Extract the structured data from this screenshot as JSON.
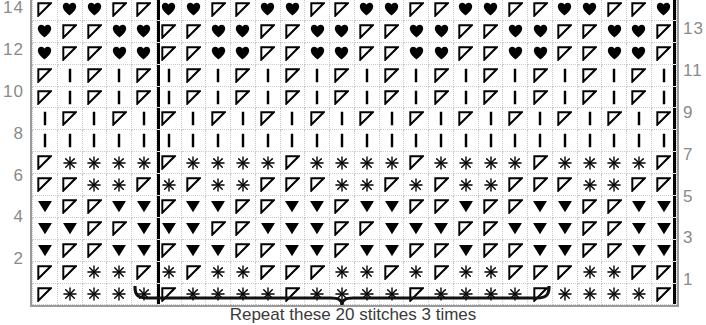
{
  "chart_data": {
    "type": "table",
    "grid_columns": 26,
    "grid_rows": 14,
    "symbol_legend": {
      "heart": "heart-symbol",
      "rt": "right-leaning-open-triangle",
      "dt": "filled-down-triangle",
      "bar": "vertical-bar-purl",
      "star": "asterisk-star"
    },
    "row_numbers_left": [
      "14",
      "12",
      "10",
      "8",
      "6",
      "4",
      "2"
    ],
    "row_numbers_right": [
      "13",
      "11",
      "9",
      "7",
      "5",
      "3",
      "1"
    ],
    "rows": [
      {
        "number": "14",
        "cells": [
          "rt",
          "heart",
          "heart",
          "rt",
          "rt",
          "heart",
          "heart",
          "rt",
          "rt",
          "heart",
          "heart",
          "rt",
          "rt",
          "heart",
          "heart",
          "rt",
          "rt",
          "heart",
          "heart",
          "rt",
          "rt",
          "heart",
          "heart",
          "rt",
          "rt",
          "heart"
        ]
      },
      {
        "number": "13",
        "cells": [
          "heart",
          "rt",
          "rt",
          "heart",
          "heart",
          "rt",
          "rt",
          "heart",
          "heart",
          "rt",
          "rt",
          "heart",
          "heart",
          "rt",
          "rt",
          "heart",
          "heart",
          "rt",
          "rt",
          "heart",
          "heart",
          "rt",
          "rt",
          "heart",
          "heart",
          "rt"
        ]
      },
      {
        "number": "12",
        "cells": [
          "heart",
          "rt",
          "rt",
          "heart",
          "heart",
          "rt",
          "rt",
          "heart",
          "heart",
          "rt",
          "rt",
          "heart",
          "heart",
          "rt",
          "rt",
          "heart",
          "heart",
          "rt",
          "rt",
          "heart",
          "heart",
          "rt",
          "rt",
          "heart",
          "heart",
          "rt"
        ]
      },
      {
        "number": "11",
        "cells": [
          "rt",
          "bar",
          "rt",
          "bar",
          "rt",
          "bar",
          "rt",
          "bar",
          "rt",
          "bar",
          "rt",
          "bar",
          "rt",
          "bar",
          "rt",
          "bar",
          "rt",
          "bar",
          "rt",
          "bar",
          "rt",
          "bar",
          "rt",
          "bar",
          "rt",
          "bar"
        ]
      },
      {
        "number": "10",
        "cells": [
          "rt",
          "bar",
          "rt",
          "bar",
          "rt",
          "bar",
          "rt",
          "bar",
          "rt",
          "bar",
          "rt",
          "bar",
          "rt",
          "bar",
          "rt",
          "bar",
          "rt",
          "bar",
          "rt",
          "bar",
          "rt",
          "bar",
          "rt",
          "bar",
          "rt",
          "bar"
        ]
      },
      {
        "number": "9",
        "cells": [
          "bar",
          "rt",
          "bar",
          "rt",
          "bar",
          "rt",
          "bar",
          "rt",
          "bar",
          "rt",
          "bar",
          "rt",
          "bar",
          "rt",
          "bar",
          "rt",
          "bar",
          "rt",
          "bar",
          "rt",
          "bar",
          "rt",
          "bar",
          "rt",
          "bar",
          "rt"
        ]
      },
      {
        "number": "8",
        "cells": [
          "bar",
          "bar",
          "bar",
          "bar",
          "bar",
          "bar",
          "bar",
          "bar",
          "bar",
          "bar",
          "bar",
          "bar",
          "bar",
          "bar",
          "bar",
          "bar",
          "bar",
          "bar",
          "bar",
          "bar",
          "bar",
          "bar",
          "bar",
          "bar",
          "bar",
          "bar"
        ]
      },
      {
        "number": "7",
        "cells": [
          "rt",
          "star",
          "star",
          "star",
          "star",
          "rt",
          "star",
          "star",
          "star",
          "star",
          "rt",
          "star",
          "star",
          "star",
          "star",
          "rt",
          "star",
          "star",
          "star",
          "star",
          "rt",
          "star",
          "star",
          "star",
          "star",
          "rt"
        ]
      },
      {
        "number": "6",
        "cells": [
          "rt",
          "rt",
          "star",
          "star",
          "rt",
          "star",
          "rt",
          "star",
          "star",
          "rt",
          "rt",
          "rt",
          "star",
          "star",
          "rt",
          "star",
          "rt",
          "star",
          "star",
          "rt",
          "rt",
          "rt",
          "star",
          "star",
          "rt",
          "rt"
        ]
      },
      {
        "number": "5",
        "cells": [
          "dt",
          "rt",
          "rt",
          "dt",
          "dt",
          "rt",
          "dt",
          "dt",
          "rt",
          "rt",
          "dt",
          "dt",
          "rt",
          "dt",
          "dt",
          "rt",
          "rt",
          "dt",
          "rt",
          "rt",
          "dt",
          "dt",
          "rt",
          "rt",
          "dt",
          "dt"
        ]
      },
      {
        "number": "4",
        "cells": [
          "dt",
          "dt",
          "rt",
          "rt",
          "dt",
          "dt",
          "dt",
          "rt",
          "rt",
          "dt",
          "dt",
          "dt",
          "rt",
          "rt",
          "dt",
          "dt",
          "dt",
          "rt",
          "rt",
          "dt",
          "dt",
          "dt",
          "rt",
          "rt",
          "dt",
          "dt"
        ]
      },
      {
        "number": "3",
        "cells": [
          "dt",
          "rt",
          "rt",
          "dt",
          "dt",
          "rt",
          "dt",
          "dt",
          "rt",
          "rt",
          "dt",
          "dt",
          "rt",
          "dt",
          "dt",
          "rt",
          "rt",
          "dt",
          "rt",
          "rt",
          "dt",
          "dt",
          "rt",
          "rt",
          "dt",
          "dt"
        ]
      },
      {
        "number": "2",
        "cells": [
          "rt",
          "rt",
          "star",
          "star",
          "rt",
          "star",
          "rt",
          "star",
          "star",
          "rt",
          "rt",
          "rt",
          "star",
          "star",
          "rt",
          "star",
          "rt",
          "star",
          "star",
          "rt",
          "rt",
          "rt",
          "star",
          "star",
          "rt",
          "rt"
        ]
      },
      {
        "number": "1",
        "cells": [
          "rt",
          "star",
          "star",
          "star",
          "star",
          "rt",
          "star",
          "star",
          "star",
          "star",
          "rt",
          "star",
          "star",
          "star",
          "star",
          "rt",
          "star",
          "star",
          "star",
          "star",
          "rt",
          "star",
          "star",
          "star",
          "star",
          "rt"
        ]
      }
    ],
    "repeat": {
      "start_column": 5,
      "end_column": 25,
      "stitch_count": 20,
      "times": 3,
      "caption": "Repeat these 20 stitches 3 times"
    }
  }
}
